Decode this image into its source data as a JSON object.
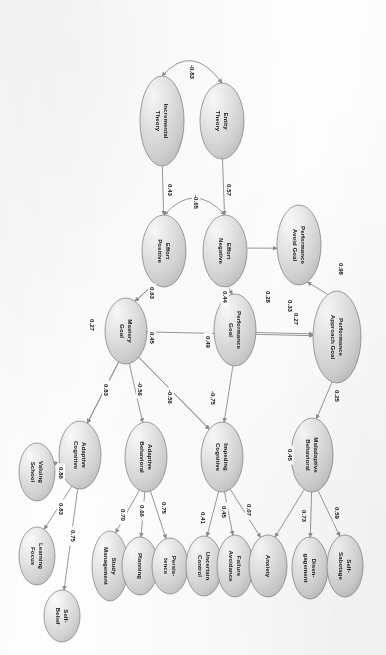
{
  "figure": {
    "kind": "sem-path-diagram",
    "orientation": "rotated-90-clockwise",
    "background_color": "#fefefe",
    "node_fill_color": "#d9d9d9",
    "node_stroke_color": "#8a8a8a",
    "edge_color": "#8d8d8d",
    "label_color": "#1b1b1b"
  },
  "chart_data": {
    "type": "diagram",
    "title": "",
    "nodes": [
      {
        "id": "incremental_theory",
        "label": "Incremental\nTheory",
        "line1": "Incremental",
        "line2": "Theory",
        "cx": 162,
        "cy": 121,
        "rx": 22,
        "ry": 45
      },
      {
        "id": "entity_theory",
        "label": "Entity\nTheory",
        "line1": "Entity",
        "line2": "Theory",
        "cx": 222,
        "cy": 121,
        "rx": 22,
        "ry": 38
      },
      {
        "id": "effort_positive",
        "label": "Effort\nPositive",
        "line1": "Effort",
        "line2": "Positive",
        "cx": 164,
        "cy": 251,
        "rx": 22,
        "ry": 36
      },
      {
        "id": "effort_negative",
        "label": "Effort\nNegative",
        "line1": "Effort",
        "line2": "Negative",
        "cx": 225,
        "cy": 251,
        "rx": 22,
        "ry": 36
      },
      {
        "id": "performance_avoid_goal",
        "label": "Performance\nAvoid Goal",
        "line1": "Performance",
        "line2": "Avoid Goal",
        "cx": 299,
        "cy": 245,
        "rx": 22,
        "ry": 40
      },
      {
        "id": "performance_approach_goal",
        "label": "Performance\nApproach Goal",
        "line1": "Performance",
        "line2": "Approach Goal",
        "cx": 337,
        "cy": 337,
        "rx": 24,
        "ry": 46
      },
      {
        "id": "mastery_goal",
        "label": "Mastery\nGoal",
        "line1": "Mastery",
        "line2": "Goal",
        "cx": 126,
        "cy": 331,
        "rx": 21,
        "ry": 33
      },
      {
        "id": "performance_goal",
        "label": "Performance\nGoal",
        "line1": "Performance",
        "line2": "Goal",
        "cx": 235,
        "cy": 330,
        "rx": 21,
        "ry": 36
      },
      {
        "id": "adaptive_cognitive",
        "label": "Adaptive\nCognitive",
        "line1": "Adaptive",
        "line2": "Cognitive",
        "cx": 80,
        "cy": 455,
        "rx": 21,
        "ry": 34
      },
      {
        "id": "adaptive_behavioral",
        "label": "Adaptive\nBehavioral",
        "line1": "Adaptive",
        "line2": "Behavioral",
        "cx": 146,
        "cy": 457,
        "rx": 21,
        "ry": 35
      },
      {
        "id": "impeding_cognitive",
        "label": "Impeding\nCognitive",
        "line1": "Impeding",
        "line2": "Cognitive",
        "cx": 222,
        "cy": 457,
        "rx": 21,
        "ry": 35
      },
      {
        "id": "maladaptive_behavioral",
        "label": "Maladaptive\nBehavioral",
        "line1": "Maladaptive",
        "line2": "Behavioral",
        "cx": 312,
        "cy": 455,
        "rx": 21,
        "ry": 37
      },
      {
        "id": "valuing_school",
        "label": "Valuing\nSchool",
        "line1": "Valuing",
        "line2": "School",
        "cx": 37,
        "cy": 472,
        "rx": 18,
        "ry": 29
      },
      {
        "id": "learning_focus",
        "label": "Learning\nFocus",
        "line1": "Learning",
        "line2": "Focus",
        "cx": 37,
        "cy": 556,
        "rx": 18,
        "ry": 29
      },
      {
        "id": "self_belief",
        "label": "Self-\nBelief",
        "line1": "Self-",
        "line2": "Belief",
        "cx": 62,
        "cy": 616,
        "rx": 18,
        "ry": 26
      },
      {
        "id": "study_management",
        "label": "Study\nManagement",
        "line1": "Study",
        "line2": "Management",
        "cx": 110,
        "cy": 566,
        "rx": 18,
        "ry": 35
      },
      {
        "id": "planning",
        "label": "Planning",
        "line1": "Planning",
        "line2": "",
        "cx": 140,
        "cy": 566,
        "rx": 18,
        "ry": 29
      },
      {
        "id": "persistence",
        "label": "Persis-\ntence",
        "line1": "Persis-",
        "line2": "tence",
        "cx": 170,
        "cy": 566,
        "rx": 18,
        "ry": 28
      },
      {
        "id": "uncertain_control",
        "label": "Uncertain\nControl",
        "line1": "Uncertain",
        "line2": "Control",
        "cx": 204,
        "cy": 566,
        "rx": 18,
        "ry": 30
      },
      {
        "id": "failure_avoidance",
        "label": "Failure\nAvoidance",
        "line1": "Failure",
        "line2": "Avoidance",
        "cx": 235,
        "cy": 566,
        "rx": 18,
        "ry": 31
      },
      {
        "id": "anxiety",
        "label": "Anxiety",
        "line1": "Anxiety",
        "line2": "",
        "cx": 268,
        "cy": 566,
        "rx": 19,
        "ry": 31
      },
      {
        "id": "disengagement",
        "label": "Disen-\ngagement",
        "line1": "Disen-",
        "line2": "gagement",
        "cx": 310,
        "cy": 568,
        "rx": 18,
        "ry": 31
      },
      {
        "id": "self_sabotage",
        "label": "Self-\nSabotage",
        "line1": "Self-",
        "line2": "Sabotage",
        "cx": 345,
        "cy": 566,
        "rx": 18,
        "ry": 31
      }
    ],
    "edges": [
      {
        "from": "incremental_theory",
        "to": "entity_theory",
        "value": "-0.83",
        "style": "curved-double",
        "label_x": 192,
        "label_y": 72
      },
      {
        "from": "incremental_theory",
        "to": "effort_positive",
        "value": "0.43",
        "label_x": 170,
        "label_y": 190
      },
      {
        "from": "entity_theory",
        "to": "effort_negative",
        "value": "0.57",
        "label_x": 229,
        "label_y": 190
      },
      {
        "from": "effort_positive",
        "to": "effort_negative",
        "value": "-0.65",
        "style": "curved-double",
        "label_x": 196,
        "label_y": 202
      },
      {
        "from": "effort_positive",
        "to": "mastery_goal",
        "value": "0.63",
        "label_x": 152,
        "label_y": 293
      },
      {
        "from": "effort_negative",
        "to": "performance_goal",
        "value": "0.44",
        "label_x": 225,
        "label_y": 297
      },
      {
        "from": "effort_negative",
        "to": "performance_avoid_goal",
        "value": "0.28",
        "label_x": 268,
        "label_y": 297
      },
      {
        "from": "performance_approach_goal",
        "to": "performance_avoid_goal",
        "value": "0.98",
        "label_x": 341,
        "label_y": 269
      },
      {
        "from": "mastery_goal",
        "to": "performance_approach_goal",
        "value": "0.27",
        "label_x": 296,
        "label_y": 319
      },
      {
        "from": "performance_goal",
        "to": "performance_approach_goal",
        "value": "0.33",
        "label_x": 290,
        "label_y": 306
      },
      {
        "from": "mastery_goal",
        "to": "adaptive_cognitive",
        "value": "0.27",
        "label_x": 92,
        "label_y": 325
      },
      {
        "from": "effort_positive",
        "to": "mastery_goal_b",
        "value": "0.45",
        "label_x": 152,
        "label_y": 338
      },
      {
        "from": "performance_goal",
        "to": "impeding_cognitive",
        "value": "0.49",
        "label_x": 208,
        "label_y": 342
      },
      {
        "from": "mastery_goal",
        "to": "adaptive_cognitive2",
        "value": "0.83",
        "label_x": 106,
        "label_y": 390
      },
      {
        "from": "mastery_goal",
        "to": "adaptive_behavioral",
        "value": "-0.56",
        "label_x": 140,
        "label_y": 389
      },
      {
        "from": "mastery_goal",
        "to": "impeding_cognitive",
        "value": "-0.56",
        "label_x": 170,
        "label_y": 397
      },
      {
        "from": "mastery_goal",
        "to": "impeding_cognitive2",
        "value": "-0.75",
        "label_x": 213,
        "label_y": 398
      },
      {
        "from": "performance_approach_goal",
        "to": "maladaptive_behavioral",
        "value": "0.25",
        "label_x": 337,
        "label_y": 396
      },
      {
        "from": "maladaptive_behavioral",
        "to": "anxiety",
        "value": "0.45",
        "label_x": 290,
        "label_y": 455
      },
      {
        "from": "adaptive_cognitive",
        "to": "valuing_school",
        "value": "0.86",
        "label_x": 61,
        "label_y": 473
      },
      {
        "from": "adaptive_cognitive",
        "to": "learning_focus",
        "value": "0.83",
        "label_x": 61,
        "label_y": 509
      },
      {
        "from": "adaptive_cognitive",
        "to": "self_belief",
        "value": "0.75",
        "label_x": 73,
        "label_y": 536
      },
      {
        "from": "adaptive_behavioral",
        "to": "study_management",
        "value": "0.70",
        "label_x": 123,
        "label_y": 515
      },
      {
        "from": "adaptive_behavioral",
        "to": "planning",
        "value": "0.66",
        "label_x": 142,
        "label_y": 511
      },
      {
        "from": "adaptive_behavioral",
        "to": "persistence",
        "value": "0.75",
        "label_x": 164,
        "label_y": 508
      },
      {
        "from": "impeding_cognitive",
        "to": "uncertain_control",
        "value": "0.41",
        "label_x": 203,
        "label_y": 518
      },
      {
        "from": "impeding_cognitive",
        "to": "failure_avoidance",
        "value": "0.45",
        "label_x": 224,
        "label_y": 512
      },
      {
        "from": "impeding_cognitive",
        "to": "anxiety",
        "value": "0.07",
        "label_x": 249,
        "label_y": 510
      },
      {
        "from": "maladaptive_behavioral",
        "to": "disengagement",
        "value": "0.73",
        "label_x": 304,
        "label_y": 516
      },
      {
        "from": "maladaptive_behavioral",
        "to": "self_sabotage",
        "value": "0.59",
        "label_x": 337,
        "label_y": 513
      }
    ]
  }
}
